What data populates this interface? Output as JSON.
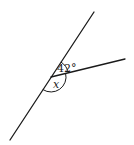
{
  "diagram": {
    "type": "angle-diagram",
    "colors": {
      "stroke": "#1a1a1a",
      "background": "#ffffff"
    },
    "labels": {
      "known_angle": "42°",
      "unknown_angle": "x"
    },
    "geometry": {
      "line": {
        "x1": 94,
        "y1": 12,
        "x2": 10,
        "y2": 140
      },
      "ray": {
        "x1": 51,
        "y1": 77,
        "x2": 125,
        "y2": 59
      },
      "vertex": {
        "x": 51,
        "y": 77
      }
    }
  }
}
